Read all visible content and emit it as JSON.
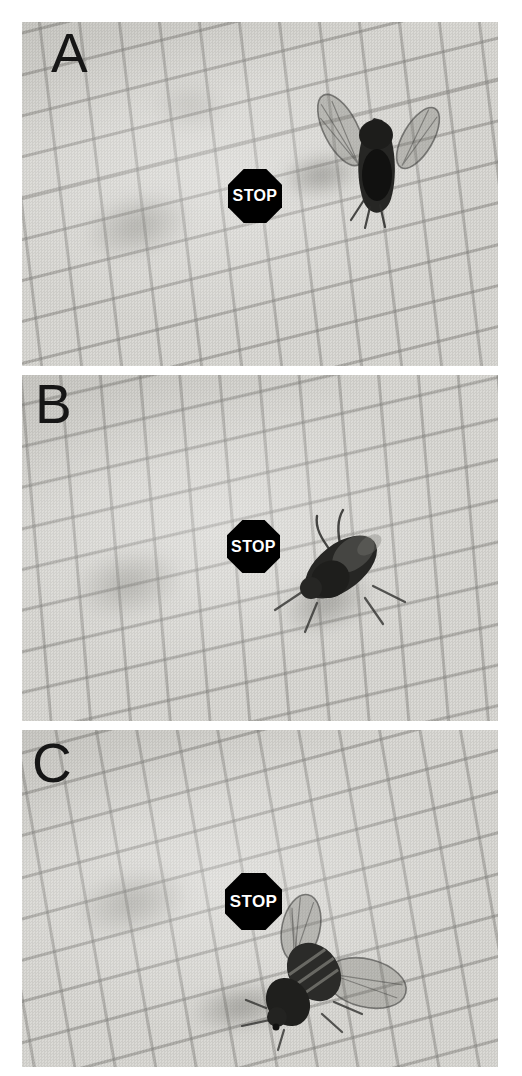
{
  "figure": {
    "panels": [
      {
        "label": "A",
        "stop_sign": {
          "label": "STOP"
        },
        "fly_pose": "fly to the right of the sign, wings raised and spread in a V"
      },
      {
        "label": "B",
        "stop_sign": {
          "label": "STOP"
        },
        "fly_pose": "fly with wings folded, walking toward the sign from the lower right"
      },
      {
        "label": "C",
        "stop_sign": {
          "label": "STOP"
        },
        "fly_pose": "fly just below the sign, left wing raised and right wing extended"
      }
    ],
    "colors": {
      "page_background": "#ffffff",
      "paper": "#d8d7d3",
      "grid_line": "#7d7c78",
      "stop_sign_fill": "#000000",
      "stop_sign_text": "#ffffff",
      "panel_label": "#161616",
      "fly_body": "#262624"
    }
  }
}
